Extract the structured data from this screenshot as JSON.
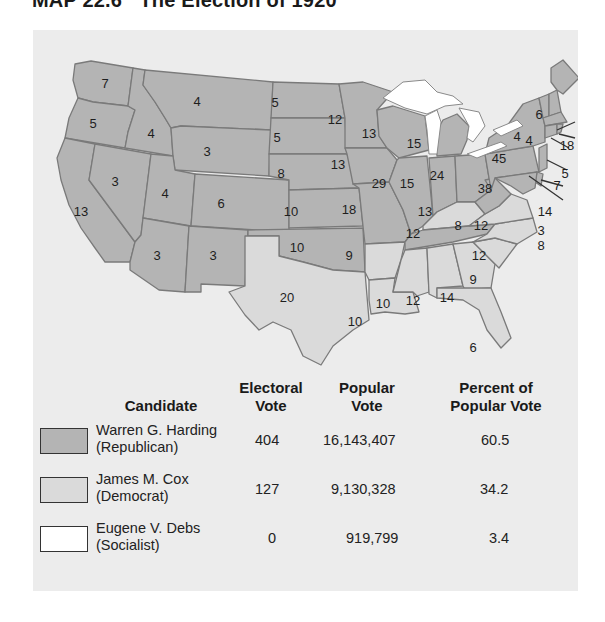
{
  "title": "MAP 22.6   The Election of 1920",
  "colors": {
    "republican": "#b4b4b4",
    "democrat": "#dadada",
    "socialist": "#ffffff",
    "panel": "#ececec"
  },
  "map": {
    "states": {
      "WA": {
        "ev": "7",
        "party": "Republican"
      },
      "OR": {
        "ev": "5",
        "party": "Republican"
      },
      "CA": {
        "ev": "13",
        "party": "Republican"
      },
      "ID": {
        "ev": "4",
        "party": "Republican"
      },
      "NV": {
        "ev": "3",
        "party": "Republican"
      },
      "MT": {
        "ev": "4",
        "party": "Republican"
      },
      "WY": {
        "ev": "3",
        "party": "Republican"
      },
      "UT": {
        "ev": "4",
        "party": "Republican"
      },
      "AZ": {
        "ev": "3",
        "party": "Republican"
      },
      "CO": {
        "ev": "6",
        "party": "Republican"
      },
      "NM": {
        "ev": "3",
        "party": "Republican"
      },
      "ND": {
        "ev": "5",
        "party": "Republican"
      },
      "SD": {
        "ev": "5",
        "party": "Republican"
      },
      "NE": {
        "ev": "8",
        "party": "Republican"
      },
      "KS": {
        "ev": "10",
        "party": "Republican"
      },
      "OK": {
        "ev": "10",
        "party": "Republican"
      },
      "TX": {
        "ev": "20",
        "party": "Democrat"
      },
      "MN": {
        "ev": "12",
        "party": "Republican"
      },
      "IA": {
        "ev": "13",
        "party": "Republican"
      },
      "MO": {
        "ev": "18",
        "party": "Republican"
      },
      "AR": {
        "ev": "9",
        "party": "Democrat"
      },
      "LA": {
        "ev": "10",
        "party": "Democrat"
      },
      "WI": {
        "ev": "13",
        "party": "Republican"
      },
      "IL": {
        "ev": "29",
        "party": "Republican"
      },
      "MI": {
        "ev": "15",
        "party": "Republican"
      },
      "IN": {
        "ev": "15",
        "party": "Republican"
      },
      "OH": {
        "ev": "24",
        "party": "Republican"
      },
      "KY": {
        "ev": "13",
        "party": "Democrat"
      },
      "TN": {
        "ev": "12",
        "party": "Republican"
      },
      "MS": {
        "ev": "10",
        "party": "Democrat"
      },
      "AL": {
        "ev": "12",
        "party": "Democrat"
      },
      "GA": {
        "ev": "14",
        "party": "Democrat"
      },
      "FL": {
        "ev": "6",
        "party": "Democrat"
      },
      "SC": {
        "ev": "9",
        "party": "Democrat"
      },
      "NC": {
        "ev": "12",
        "party": "Democrat"
      },
      "VA": {
        "ev": "12",
        "party": "Democrat"
      },
      "WV": {
        "ev": "8",
        "party": "Republican"
      },
      "PA": {
        "ev": "38",
        "party": "Republican"
      },
      "NY": {
        "ev": "45",
        "party": "Republican"
      },
      "VT": {
        "ev": "4",
        "party": "Republican"
      },
      "NH": {
        "ev": "4",
        "party": "Republican"
      },
      "ME": {
        "ev": "6",
        "party": "Republican"
      },
      "MA": {
        "ev": "18",
        "party": "Republican"
      },
      "RI": {
        "ev": "5",
        "party": "Republican"
      },
      "CT": {
        "ev": "7",
        "party": "Republican"
      },
      "NJ": {
        "ev": "14",
        "party": "Republican"
      },
      "DE": {
        "ev": "3",
        "party": "Republican"
      },
      "MD": {
        "ev": "8",
        "party": "Republican"
      }
    }
  },
  "table": {
    "headers": {
      "candidate": "Candidate",
      "electoral_1": "Electoral",
      "electoral_2": "Vote",
      "popular_1": "Popular",
      "popular_2": "Vote",
      "percent_1": "Percent of",
      "percent_2": "Popular Vote"
    },
    "rows": [
      {
        "name": "Warren G. Harding",
        "party": "(Republican)",
        "electoral": "404",
        "popular": "16,143,407",
        "percent": "60.5"
      },
      {
        "name": "James M. Cox",
        "party": "(Democrat)",
        "electoral": "127",
        "popular": "9,130,328",
        "percent": "34.2"
      },
      {
        "name": "Eugene V. Debs",
        "party": "(Socialist)",
        "electoral": "0",
        "popular": "919,799",
        "percent": "3.4"
      }
    ]
  }
}
